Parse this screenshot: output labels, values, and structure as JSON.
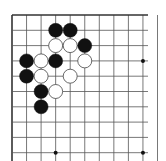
{
  "board": {
    "description": "Go board top-left corner diagram",
    "origin": {
      "x": 12,
      "y": 15
    },
    "spacing": {
      "x": 14.55,
      "y": 15.3
    },
    "cols": 11,
    "rows": 10,
    "edge_top": true,
    "edge_left": true,
    "colors": {
      "line": "#555555",
      "edge": "#333333",
      "black_stone": "#111111",
      "white_stone": "#ffffff",
      "white_outline": "#444444",
      "background": "#ffffff"
    },
    "star_points": [
      {
        "col": 9,
        "row": 3
      },
      {
        "col": 3,
        "row": 9
      },
      {
        "col": 9,
        "row": 9
      }
    ],
    "stones": [
      {
        "color": "black",
        "col": 3,
        "row": 1
      },
      {
        "color": "black",
        "col": 4,
        "row": 1
      },
      {
        "color": "white",
        "col": 3,
        "row": 2
      },
      {
        "color": "white",
        "col": 4,
        "row": 2
      },
      {
        "color": "black",
        "col": 5,
        "row": 2
      },
      {
        "color": "black",
        "col": 1,
        "row": 3
      },
      {
        "color": "white",
        "col": 2,
        "row": 3
      },
      {
        "color": "black",
        "col": 3,
        "row": 3
      },
      {
        "color": "white",
        "col": 5,
        "row": 3
      },
      {
        "color": "black",
        "col": 1,
        "row": 4
      },
      {
        "color": "white",
        "col": 2,
        "row": 4
      },
      {
        "color": "white",
        "col": 4,
        "row": 4
      },
      {
        "color": "black",
        "col": 2,
        "row": 5
      },
      {
        "color": "white",
        "col": 3,
        "row": 5
      },
      {
        "color": "black",
        "col": 2,
        "row": 6
      }
    ]
  }
}
